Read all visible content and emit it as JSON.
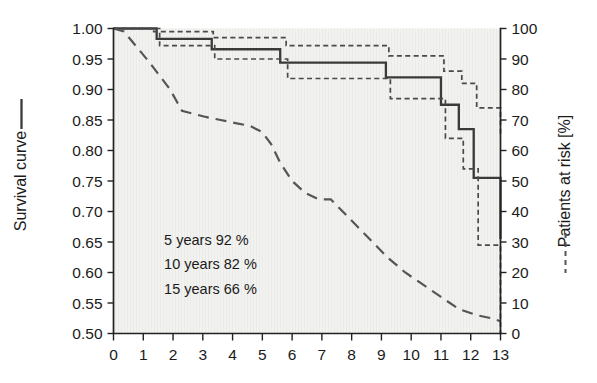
{
  "chart_data": {
    "type": "line",
    "title": "",
    "subtitle": "",
    "xlabel": "",
    "xlim": [
      0,
      13
    ],
    "x_ticks": [
      0,
      1,
      2,
      3,
      4,
      5,
      6,
      7,
      8,
      9,
      10,
      11,
      12,
      13
    ],
    "x_tick_labels": [
      "0",
      "1",
      "2",
      "3",
      "4",
      "5",
      "6",
      "7",
      "8",
      "9",
      "10",
      "11",
      "12",
      "13"
    ],
    "left_axis": {
      "label": "Survival curve",
      "legend_marker": "solid-line",
      "ylim": [
        0.5,
        1.0
      ],
      "ticks": [
        0.5,
        0.55,
        0.6,
        0.65,
        0.7,
        0.75,
        0.8,
        0.85,
        0.9,
        0.95,
        1.0
      ],
      "tick_labels": [
        "0.50",
        "0.55",
        "0.60",
        "0.65",
        "0.70",
        "0.75",
        "0.80",
        "0.85",
        "0.90",
        "0.95",
        "1.00"
      ]
    },
    "right_axis": {
      "label": "Patients at risk [%]",
      "legend_marker": "dashed-line",
      "ylim": [
        0,
        100
      ],
      "ticks": [
        0,
        10,
        20,
        30,
        40,
        50,
        60,
        70,
        80,
        90,
        100
      ],
      "tick_labels": [
        "0",
        "10",
        "20",
        "30",
        "40",
        "50",
        "60",
        "70",
        "80",
        "90",
        "100"
      ]
    },
    "grid": false,
    "legend_position": "axis-labels",
    "series": [
      {
        "name": "Survival curve",
        "style": "solid",
        "axis": "left",
        "step": "post",
        "x": [
          0.0,
          1.0,
          1.45,
          2.4,
          3.3,
          4.7,
          5.6,
          8.05,
          9.15,
          10.3,
          11.0,
          11.6,
          12.1,
          13.0
        ],
        "y": [
          1.0,
          1.0,
          0.983,
          0.983,
          0.966,
          0.966,
          0.944,
          0.944,
          0.92,
          0.92,
          0.875,
          0.835,
          0.755,
          0.655
        ]
      },
      {
        "name": "Upper 95% confidence limit",
        "style": "dotted",
        "axis": "left",
        "step": "post",
        "x": [
          0.0,
          1.35,
          2.45,
          3.35,
          4.85,
          5.8,
          8.15,
          9.25,
          10.4,
          11.1,
          11.7,
          12.2,
          13.0
        ],
        "y": [
          1.0,
          0.995,
          0.995,
          0.985,
          0.985,
          0.972,
          0.972,
          0.955,
          0.955,
          0.93,
          0.91,
          0.87,
          0.825
        ]
      },
      {
        "name": "Lower 95% confidence limit",
        "style": "dotted",
        "axis": "left",
        "step": "post",
        "x": [
          0.0,
          1.55,
          2.5,
          3.4,
          4.9,
          5.85,
          8.2,
          9.3,
          10.45,
          11.15,
          11.75,
          12.25,
          13.0
        ],
        "y": [
          1.0,
          0.972,
          0.972,
          0.95,
          0.95,
          0.918,
          0.918,
          0.885,
          0.885,
          0.82,
          0.77,
          0.645,
          0.5
        ]
      },
      {
        "name": "Patients at risk",
        "style": "dashed",
        "axis": "right",
        "step": "linear",
        "x": [
          0.0,
          0.35,
          1.2,
          1.9,
          2.3,
          3.1,
          3.6,
          4.1,
          4.6,
          5.0,
          5.3,
          5.6,
          6.0,
          6.45,
          6.9,
          7.3,
          7.7,
          8.2,
          8.7,
          9.2,
          9.8,
          10.4,
          11.0,
          11.6,
          12.2,
          12.7,
          13.0
        ],
        "y": [
          100,
          99,
          89,
          80,
          73,
          71,
          70,
          69,
          68,
          66,
          62,
          56,
          50,
          46,
          44,
          44,
          40,
          35,
          30,
          25,
          20,
          16,
          12,
          8,
          6,
          5,
          4
        ]
      }
    ],
    "annotations": [
      {
        "label": "5 years 92 %",
        "x": 1.7,
        "y": 0.645
      },
      {
        "label": "10 years 82 %",
        "x": 1.7,
        "y": 0.605
      },
      {
        "label": "15 years 66 %",
        "x": 1.7,
        "y": 0.565
      }
    ]
  },
  "colors": {
    "plot_background": "#f2f2f0",
    "axis": "#222222",
    "survival_curve": "#3a3a3a",
    "confidence_band": "#4a4a4a",
    "risk_curve": "#555555",
    "text": "#1b1b1b"
  }
}
